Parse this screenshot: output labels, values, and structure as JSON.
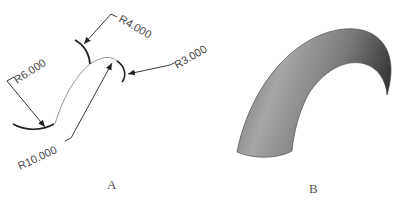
{
  "figure": {
    "panel_a": {
      "label": "A",
      "dimensions": {
        "r4": "R4.000",
        "r6": "R6.000",
        "r3": "R3.000",
        "r10": "R10.000"
      }
    },
    "panel_b": {
      "label": "B"
    }
  },
  "colors": {
    "line": "#222222",
    "thin_line": "#777777",
    "text": "#444444",
    "shade_light": "#9a9a9a",
    "shade_dark": "#3c3c3c"
  }
}
